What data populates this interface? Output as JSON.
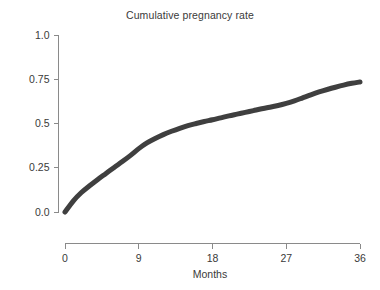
{
  "chart_data": {
    "type": "line",
    "title": "Cumulative pregnancy rate",
    "xlabel": "Months",
    "ylabel": "",
    "xlim": [
      0,
      36
    ],
    "ylim": [
      0,
      1.0
    ],
    "grid": false,
    "legend": "none",
    "line_color": "#3f3f3f",
    "line_width": 5,
    "x_ticks": [
      {
        "value": 0,
        "label": "0"
      },
      {
        "value": 9,
        "label": "9"
      },
      {
        "value": 18,
        "label": "18"
      },
      {
        "value": 27,
        "label": "27"
      },
      {
        "value": 36,
        "label": "36"
      }
    ],
    "y_ticks": [
      {
        "value": 0.0,
        "label": "0.0"
      },
      {
        "value": 0.25,
        "label": "0.25"
      },
      {
        "value": 0.5,
        "label": "0.5"
      },
      {
        "value": 0.75,
        "label": "0.75"
      },
      {
        "value": 1.0,
        "label": "1.0"
      }
    ],
    "series": [
      {
        "name": "Cumulative pregnancy rate",
        "x": [
          0,
          1,
          2,
          3,
          4,
          5,
          6,
          7,
          8,
          9,
          10,
          11,
          12,
          13,
          14,
          15,
          16,
          17,
          18,
          19,
          20,
          21,
          22,
          23,
          24,
          25,
          26,
          27,
          28,
          29,
          30,
          31,
          32,
          33,
          34,
          35,
          36
        ],
        "values": [
          0.0,
          0.062,
          0.11,
          0.148,
          0.184,
          0.218,
          0.252,
          0.285,
          0.32,
          0.358,
          0.39,
          0.415,
          0.437,
          0.456,
          0.473,
          0.488,
          0.5,
          0.511,
          0.521,
          0.532,
          0.543,
          0.553,
          0.563,
          0.573,
          0.583,
          0.592,
          0.602,
          0.614,
          0.628,
          0.645,
          0.662,
          0.678,
          0.692,
          0.705,
          0.717,
          0.727,
          0.735
        ]
      }
    ]
  },
  "axis_title_x": "Months"
}
